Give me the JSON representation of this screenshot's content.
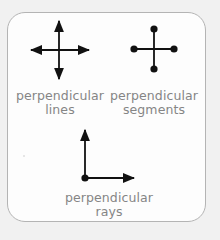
{
  "colors": {
    "background": "#f1f1f1",
    "card_fill": "#fdfdfd",
    "card_border": "#b4b4b4",
    "stroke": "#111111",
    "label_text": "#858585"
  },
  "figures": [
    {
      "id": "lines",
      "icon": "perpendicular-lines-icon",
      "label_line1": "perpendicular",
      "label_line2": "lines"
    },
    {
      "id": "segments",
      "icon": "perpendicular-segments-icon",
      "label_line1": "perpendicular",
      "label_line2": "segments"
    },
    {
      "id": "rays",
      "icon": "perpendicular-rays-icon",
      "label_line1": "perpendicular",
      "label_line2": "rays"
    }
  ]
}
